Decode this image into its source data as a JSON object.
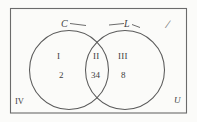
{
  "diagram": {
    "type": "venn-two-set",
    "universe": {
      "label": "U",
      "name": "universal-set",
      "outside_region_label": "IV"
    },
    "sets": [
      {
        "id": "C",
        "label": "C",
        "name": "set-c-circle"
      },
      {
        "id": "L",
        "label": "L",
        "name": "set-l-circle"
      }
    ],
    "regions": [
      {
        "id": "I",
        "roman": "I",
        "count": "2",
        "description": "C only"
      },
      {
        "id": "II",
        "roman": "II",
        "count": "34",
        "description": "C and L"
      },
      {
        "id": "III",
        "roman": "III",
        "count": "8",
        "description": "L only"
      },
      {
        "id": "IV",
        "roman": "IV",
        "count": "",
        "description": "outside both"
      }
    ],
    "marks": [
      {
        "id": "stray",
        "glyph": "/",
        "name": "stray-slash-mark"
      }
    ],
    "colors": {
      "stroke": "#5a5a5a",
      "border": "#6b6b6b",
      "text": "#3d3d3d",
      "background": "#fbfbf9"
    }
  }
}
